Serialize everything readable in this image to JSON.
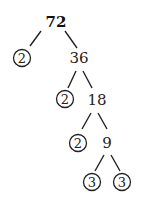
{
  "diagram": {
    "type": "factor-tree",
    "root": "72",
    "nodes": {
      "n72": "72",
      "p1": "2",
      "n36": "36",
      "p2": "2",
      "n18": "18",
      "p3": "2",
      "n9": "9",
      "p4": "3",
      "p5": "3"
    },
    "edges": [
      [
        "72",
        "2"
      ],
      [
        "72",
        "36"
      ],
      [
        "36",
        "2"
      ],
      [
        "36",
        "18"
      ],
      [
        "18",
        "2"
      ],
      [
        "18",
        "9"
      ],
      [
        "9",
        "3"
      ],
      [
        "9",
        "3"
      ]
    ],
    "prime_factors": [
      "2",
      "2",
      "2",
      "3",
      "3"
    ]
  }
}
